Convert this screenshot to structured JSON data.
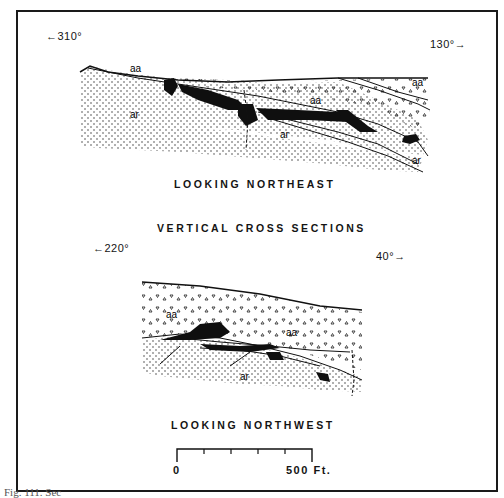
{
  "figure": {
    "title": "VERTICAL CROSS SECTIONS",
    "caption": "Fig. 111.  Sec",
    "units_legend": {
      "aa": "aa (upper volcanic unit, triangular pattern)",
      "ar": "ar (lower unit, stippled pattern)"
    },
    "colors": {
      "ink": "#141414",
      "background": "#ffffff",
      "ore_body": "#0f0f0f"
    }
  },
  "section_top": {
    "view_label": "LOOKING NORTHEAST",
    "left_bearing": "←310°",
    "right_bearing": "130°→",
    "unit_labels": [
      "aa",
      "aa",
      "aa",
      "ar",
      "ar",
      "ar"
    ]
  },
  "section_bottom": {
    "view_label": "LOOKING NORTHWEST",
    "left_bearing": "←220°",
    "right_bearing": "40°→",
    "unit_labels": [
      "aa",
      "aa",
      "ar"
    ]
  },
  "scale_bar": {
    "start_label": "0",
    "end_label": "500 Ft.",
    "ticks": 6
  }
}
